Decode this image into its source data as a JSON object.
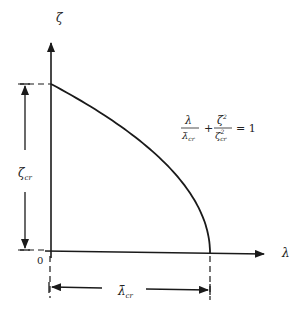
{
  "diagram": {
    "y_axis_label": "ζ",
    "x_axis_label": "λ",
    "origin_label": "0",
    "zeta_cr_label": "ζ",
    "zeta_cr_sub": "cr",
    "lambda_cr_label": "λ̄",
    "lambda_cr_sub": "cr",
    "equation": {
      "term1_num": "λ",
      "term1_den": "λ̄",
      "term1_den_sub": "cr",
      "plus": "+",
      "term2_num": "ζ",
      "term2_num_sup": "2",
      "term2_den": "ζ",
      "term2_den_sup": "2",
      "term2_den_sub": "cr",
      "equals": "= 1"
    },
    "curve": {
      "description": "λ/λ̄cr + ζ²/ζcr² = 1",
      "lambda_cr": 1,
      "zeta_cr": 1
    },
    "line_color": "#1a1a1a"
  }
}
